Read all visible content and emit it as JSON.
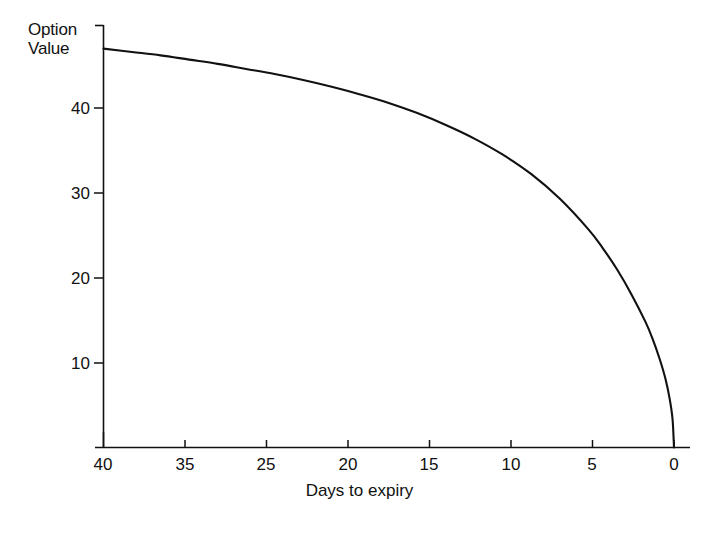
{
  "chart_data": {
    "type": "line",
    "title": "",
    "xlabel": "Days to expiry",
    "ylabel": "Option Value",
    "ylabel_line1": "Option",
    "ylabel_line2": "Value",
    "x_tick_labels": [
      "40",
      "35",
      "25",
      "20",
      "15",
      "10",
      "5",
      "0"
    ],
    "y_tick_labels": [
      "40",
      "30",
      "20",
      "10"
    ],
    "x_tick_values": [
      40,
      35,
      30,
      25,
      20,
      15,
      10,
      5
    ],
    "y_tick_values": [
      40,
      30,
      20,
      10
    ],
    "xlim": [
      40,
      0
    ],
    "ylim": [
      0,
      52
    ],
    "grid": false,
    "legend": null,
    "x_axis_direction": "decreasing",
    "line_color": "#111111",
    "x": [
      40,
      38,
      36,
      34,
      32,
      30,
      28,
      26,
      24,
      22,
      20,
      18,
      16,
      14,
      12,
      10,
      8,
      6,
      5,
      4,
      3,
      2,
      1.5,
      1,
      0.6,
      0.3,
      0.1,
      0
    ],
    "values": [
      47.0,
      46.6,
      46.2,
      45.7,
      45.2,
      44.6,
      44.0,
      43.3,
      42.5,
      41.6,
      40.6,
      39.4,
      38.0,
      36.4,
      34.5,
      32.2,
      29.3,
      25.7,
      23.5,
      21.0,
      18.1,
      14.8,
      12.8,
      10.4,
      8.1,
      5.7,
      3.3,
      0
    ],
    "series": [
      {
        "name": "Option value decay",
        "values": [
          47.0,
          46.6,
          46.2,
          45.7,
          45.2,
          44.6,
          44.0,
          43.3,
          42.5,
          41.6,
          40.6,
          39.4,
          38.0,
          36.4,
          34.5,
          32.2,
          29.3,
          25.7,
          23.5,
          21.0,
          18.1,
          14.8,
          12.8,
          10.4,
          8.1,
          5.7,
          3.3,
          0
        ]
      }
    ]
  }
}
